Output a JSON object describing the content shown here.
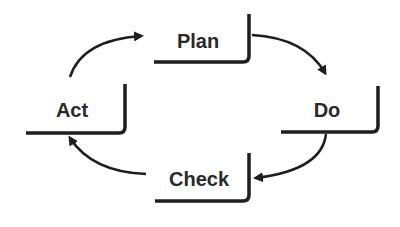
{
  "diagram": {
    "type": "cycle",
    "colors": {
      "stroke": "#1e1e1e",
      "text": "#2a2a2a",
      "background": "#ffffff"
    },
    "nodes": [
      {
        "id": "plan",
        "label": "Plan"
      },
      {
        "id": "do",
        "label": "Do"
      },
      {
        "id": "check",
        "label": "Check"
      },
      {
        "id": "act",
        "label": "Act"
      }
    ],
    "edges": [
      {
        "from": "plan",
        "to": "do"
      },
      {
        "from": "do",
        "to": "check"
      },
      {
        "from": "check",
        "to": "act"
      },
      {
        "from": "act",
        "to": "plan"
      }
    ]
  }
}
